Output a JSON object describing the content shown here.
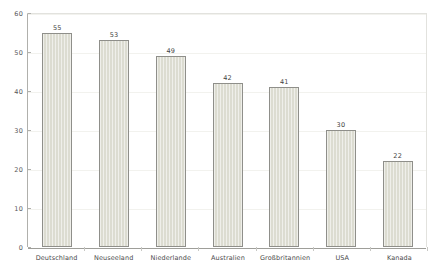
{
  "chart_data": {
    "type": "bar",
    "title": "",
    "subtitle": "",
    "xlabel": "",
    "ylabel": "",
    "ylim": [
      0,
      60
    ],
    "yticks": [
      0,
      10,
      20,
      30,
      40,
      50,
      60
    ],
    "grid": true,
    "legend": "none",
    "categories": [
      "Deutschland",
      "Neuseeland",
      "Niederlande",
      "Australien",
      "Großbritannien",
      "USA",
      "Kanada"
    ],
    "values": [
      55,
      53,
      49,
      42,
      41,
      30,
      22
    ],
    "value_labels": [
      "55",
      "53",
      "49",
      "42",
      "41",
      "30",
      "22"
    ],
    "ytick_labels": [
      "0",
      "10",
      "20",
      "30",
      "40",
      "50",
      "60"
    ],
    "colors": {
      "bar_fill": "#dcdcd1",
      "bar_border": "#8f8f8a",
      "axis_line": "#9e9e99",
      "gridline": "#f2f2ee",
      "label_text": "#4a4a4c",
      "value_text": "#3f3f41",
      "background": "#ffffff"
    }
  }
}
